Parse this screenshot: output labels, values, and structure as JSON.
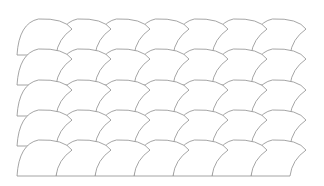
{
  "pattern": {
    "name": "fan-scale-tessellation",
    "rows": 5,
    "columns": 7,
    "origin_x": 17,
    "baselines_y": [
      55,
      85,
      116,
      146,
      176
    ],
    "tile_width": 39,
    "tile_height": 36,
    "right_overhang": 16,
    "stroke_color": "#8e8e8e",
    "fill_color": "#ffffff",
    "background_color": "#ffffff"
  }
}
